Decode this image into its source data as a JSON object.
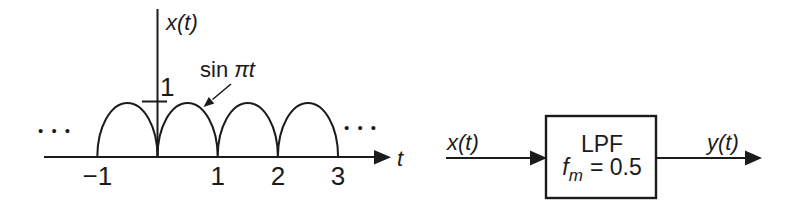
{
  "page": {
    "background": "#ffffff",
    "ink": "#1b1b1b"
  },
  "graph": {
    "y_axis_label": "x(t)",
    "x_axis_label": "t",
    "y_tick_label": "1",
    "annotation_prefix": "sin",
    "annotation_math": "πt",
    "ellipsis": "• • •"
  },
  "chart_data": {
    "type": "line",
    "title": "",
    "xlabel": "t",
    "ylabel": "x(t)",
    "function": "x(t) = |sin(πt)| (full-wave rectified sine, drawn as repeating arches)",
    "x_range": [
      -1,
      3
    ],
    "ylim": [
      0,
      1.4
    ],
    "x_ticks": [
      -1,
      1,
      2,
      3
    ],
    "y_ticks": [
      1
    ],
    "period": 1,
    "amplitude": 1,
    "grid": false,
    "annotations": [
      {
        "text": "sin πt",
        "target": "right flank of arch between t=0 and t=1"
      }
    ],
    "continues_left": true,
    "continues_right": true
  },
  "block_diagram": {
    "input_label": "x(t)",
    "output_label": "y(t)",
    "block_title": "LPF",
    "param_symbol": "f",
    "param_subscript": "m",
    "param_value": "= 0.5"
  }
}
